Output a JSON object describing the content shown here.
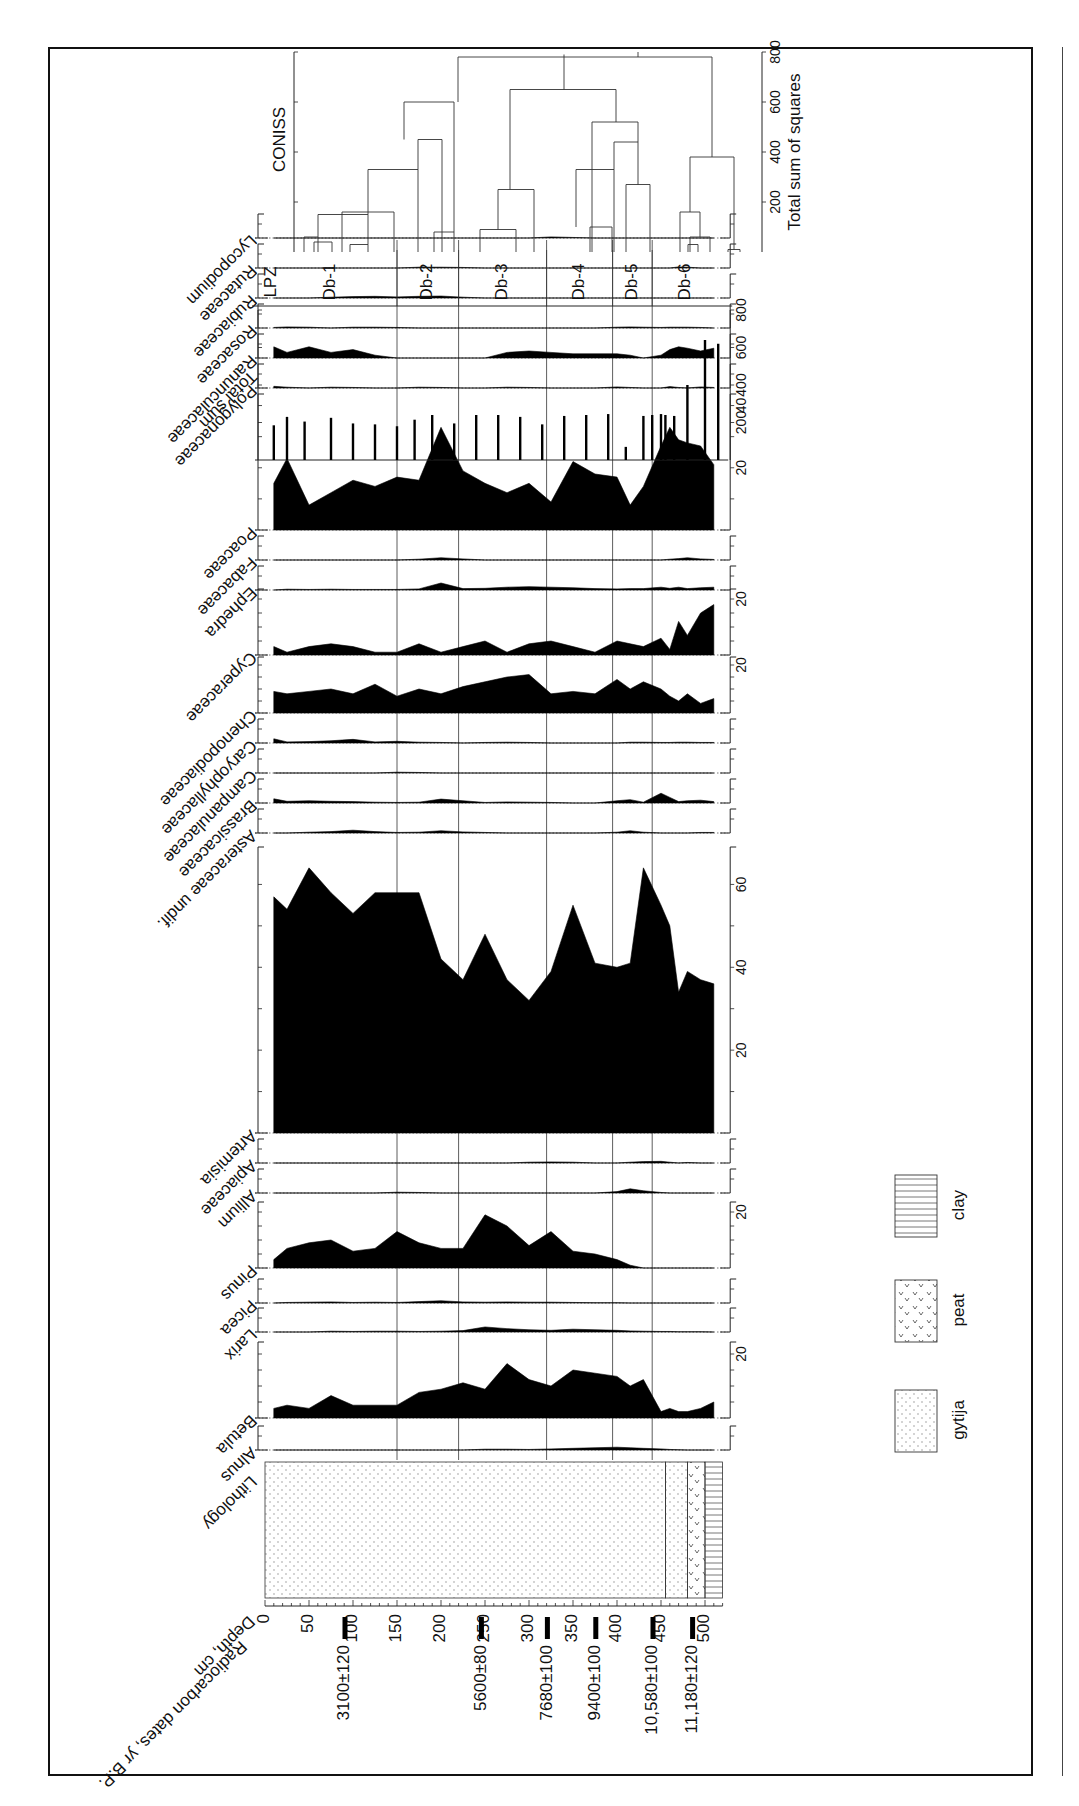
{
  "chart_data": {
    "type": "area",
    "orientation": "rotated 90 degrees (depth runs left-to-right across the page)",
    "depth_axis": {
      "label": "Depth, cm",
      "ticks": [
        0,
        50,
        100,
        150,
        200,
        250,
        300,
        350,
        400,
        450,
        500
      ],
      "range": [
        0,
        520
      ]
    },
    "radiocarbon_label": "Radiocarbon dates, yr B.P.",
    "radiocarbon_dates": [
      {
        "label": "3100±120",
        "depth": 100
      },
      {
        "label": "5600±80",
        "depth": 255
      },
      {
        "label": "7680±100",
        "depth": 330
      },
      {
        "label": "9400±100",
        "depth": 385
      },
      {
        "label": "10,580±100",
        "depth": 450
      },
      {
        "label": "11,180±120",
        "depth": 495
      }
    ],
    "lithology": {
      "label": "Lithology",
      "units": [
        {
          "type": "gytija",
          "from": 0,
          "to": 455
        },
        {
          "type": "gytija",
          "from": 455,
          "to": 480
        },
        {
          "type": "peat",
          "from": 480,
          "to": 500
        },
        {
          "type": "clay",
          "from": 500,
          "to": 520
        }
      ]
    },
    "legend": [
      {
        "name": "gytija",
        "pattern": "dots"
      },
      {
        "name": "peat",
        "pattern": "v-marks"
      },
      {
        "name": "clay",
        "pattern": "horizontal-lines"
      }
    ],
    "zones": {
      "label": "LPZ",
      "items": [
        {
          "name": "Db-1",
          "from": 0,
          "to": 150
        },
        {
          "name": "Db-2",
          "from": 150,
          "to": 220
        },
        {
          "name": "Db-3",
          "from": 220,
          "to": 320
        },
        {
          "name": "Db-4",
          "from": 320,
          "to": 395
        },
        {
          "name": "Db-5",
          "from": 395,
          "to": 440
        },
        {
          "name": "Db-6",
          "from": 440,
          "to": 520
        }
      ]
    },
    "sample_depths": [
      10,
      25,
      50,
      75,
      100,
      125,
      150,
      175,
      200,
      225,
      250,
      275,
      300,
      325,
      350,
      375,
      400,
      415,
      430,
      450,
      460,
      470,
      480,
      495,
      510
    ],
    "series": [
      {
        "name": "Alnus",
        "scale_max": 10,
        "ticks": [],
        "values": [
          0,
          0,
          0,
          0,
          0,
          0,
          0,
          0,
          0,
          0,
          0.3,
          0.3,
          0.2,
          0.4,
          0.6,
          0.8,
          1.0,
          0.8,
          0.6,
          0.4,
          0.2,
          0.1,
          0,
          0,
          0
        ]
      },
      {
        "name": "Betula",
        "scale_max": 25,
        "ticks": [
          20
        ],
        "values": [
          3,
          4,
          3,
          7,
          4,
          4,
          4,
          8,
          9,
          11,
          9,
          17,
          12,
          10,
          15,
          14,
          13,
          10,
          12,
          2,
          3,
          2,
          2,
          3,
          5
        ]
      },
      {
        "name": "Larix",
        "scale_max": 10,
        "ticks": [],
        "values": [
          0,
          0,
          0,
          0.3,
          0.2,
          0.3,
          0.3,
          0.2,
          0.3,
          0.5,
          1.8,
          1.2,
          0.8,
          0.6,
          1.0,
          0.8,
          0.6,
          0.4,
          0.3,
          0.2,
          0.2,
          0.1,
          0.1,
          0.1,
          0
        ]
      },
      {
        "name": "Picea",
        "scale_max": 10,
        "ticks": [],
        "values": [
          0,
          0.2,
          0.3,
          0.4,
          0.2,
          0.3,
          0.2,
          0.5,
          0.8,
          0.4,
          0.3,
          0.4,
          0.3,
          0.3,
          0.2,
          0.1,
          0.1,
          0,
          0,
          0,
          0,
          0,
          0,
          0,
          0
        ]
      },
      {
        "name": "Pinus",
        "scale_max": 25,
        "ticks": [
          20
        ],
        "values": [
          3,
          7,
          9,
          10,
          6,
          7,
          13,
          9,
          7,
          7,
          19,
          15,
          8,
          13,
          6,
          5,
          3,
          1,
          0,
          0,
          0,
          0,
          0,
          0,
          0
        ]
      },
      {
        "name": "Allium",
        "scale_max": 10,
        "ticks": [],
        "values": [
          0,
          0,
          0,
          0,
          0,
          0,
          0.3,
          0.2,
          0,
          0,
          0,
          0,
          0,
          0,
          0,
          0,
          0.5,
          1.5,
          0.8,
          0.2,
          0,
          0,
          0,
          0,
          0
        ]
      },
      {
        "name": "Apiaceae",
        "scale_max": 10,
        "ticks": [],
        "values": [
          0,
          0,
          0,
          0,
          0,
          0,
          0,
          0,
          0,
          0,
          0,
          0,
          0.3,
          0.4,
          0.3,
          0,
          0,
          0.3,
          0.5,
          0.6,
          0.3,
          0,
          0.2,
          0,
          0
        ]
      },
      {
        "name": "Artemisia",
        "scale_max": 70,
        "ticks": [
          20,
          40,
          60
        ],
        "values": [
          57,
          54,
          64,
          58,
          53,
          58,
          58,
          58,
          42,
          37,
          48,
          37,
          32,
          39,
          55,
          41,
          40,
          41,
          64,
          55,
          50,
          34,
          39,
          37,
          36
        ]
      },
      {
        "name": "Asteraceae undif.",
        "scale_max": 10,
        "ticks": [],
        "values": [
          0,
          0,
          0.3,
          0.5,
          1.0,
          0.5,
          0.2,
          0.3,
          0.8,
          0.4,
          0.2,
          0,
          0,
          0,
          0,
          0,
          0.3,
          0.8,
          0.3,
          0,
          0,
          0,
          0,
          0.2,
          0.2
        ]
      },
      {
        "name": "Brassicaceae",
        "scale_max": 10,
        "ticks": [],
        "values": [
          1.5,
          0.6,
          0.8,
          0.6,
          0.5,
          0.3,
          0.2,
          0.3,
          1.4,
          0.8,
          0.2,
          0.4,
          0.3,
          0.2,
          0,
          0,
          0.8,
          1.2,
          0.3,
          3.5,
          2.0,
          0.5,
          0.8,
          1.0,
          0.5
        ]
      },
      {
        "name": "Campanulaceae",
        "scale_max": 10,
        "ticks": [],
        "values": [
          0,
          0,
          0,
          0,
          0,
          0,
          0.3,
          0.2,
          0,
          0,
          0,
          0,
          0,
          0,
          0,
          0,
          0,
          0,
          0,
          0,
          0,
          0,
          0,
          0,
          0
        ]
      },
      {
        "name": "Caryophyllaceae",
        "scale_max": 10,
        "ticks": [],
        "values": [
          1.5,
          0.4,
          0.5,
          0.8,
          1.3,
          0.4,
          0.6,
          0.3,
          0.2,
          0,
          0.2,
          0.3,
          0.2,
          0,
          0,
          0,
          0,
          0.3,
          0.3,
          0.2,
          0.2,
          0.3,
          0.3,
          0.2,
          0.2
        ]
      },
      {
        "name": "Chenopodiaceae",
        "scale_max": 25,
        "ticks": [
          20
        ],
        "values": [
          9,
          8,
          9,
          10,
          8,
          12,
          7,
          10,
          8,
          11,
          13,
          15,
          16,
          8,
          9,
          8,
          14,
          10,
          13,
          10,
          7,
          5,
          8,
          4,
          6
        ]
      },
      {
        "name": "Cyperaceae",
        "scale_max": 25,
        "ticks": [
          20
        ],
        "values": [
          3,
          1,
          3,
          4,
          3,
          1,
          1,
          4,
          1,
          3,
          5,
          1,
          4,
          5,
          3,
          1,
          5,
          4,
          3,
          6,
          2,
          12,
          7,
          15,
          18
        ]
      },
      {
        "name": "Ephedra",
        "scale_max": 10,
        "ticks": [],
        "values": [
          0,
          0.3,
          0.2,
          0.3,
          0.2,
          0.2,
          0.2,
          0.4,
          2.5,
          0.5,
          0.6,
          1.0,
          1.2,
          1.0,
          0.8,
          0.5,
          0.4,
          0.5,
          0.5,
          1.0,
          0.6,
          1.0,
          0.5,
          0.8,
          1.0
        ]
      },
      {
        "name": "Fabaceae",
        "scale_max": 10,
        "ticks": [],
        "values": [
          0,
          0,
          0,
          0,
          0,
          0,
          0,
          0.3,
          0.8,
          0.4,
          0,
          0,
          0,
          0,
          0,
          0,
          0,
          0,
          0,
          0,
          0.3,
          0.5,
          0.8,
          0.4,
          0.2
        ]
      },
      {
        "name": "Poaceae",
        "scale_max": 45,
        "ticks": [
          20,
          40
        ],
        "values": [
          15,
          23,
          8,
          12,
          16,
          14,
          17,
          16,
          33,
          19,
          15,
          12,
          15,
          9,
          22,
          18,
          17,
          8,
          14,
          27,
          33,
          29,
          28,
          27,
          21
        ]
      },
      {
        "name": "Polygonaceae",
        "scale_max": 10,
        "ticks": [],
        "values": [
          0.6,
          0.3,
          0,
          0.3,
          0.2,
          0,
          0,
          0.3,
          0.2,
          0,
          0,
          0.3,
          0.2,
          0,
          0,
          0,
          0.4,
          0.2,
          0,
          0,
          0.5,
          0.2,
          0,
          0.4,
          0.2
        ]
      },
      {
        "name": "Ranunculaceae",
        "scale_max": 10,
        "ticks": [],
        "values": [
          4,
          2,
          4,
          2,
          3,
          1,
          0,
          0,
          0,
          0,
          0,
          2,
          2.5,
          2,
          1.5,
          1.5,
          1.5,
          1,
          0,
          1,
          3,
          4,
          3.5,
          2.5,
          3.5
        ]
      },
      {
        "name": "Rosaceae",
        "scale_max": 10,
        "ticks": [],
        "values": [
          0.2,
          0.4,
          0.3,
          0,
          0.3,
          0.3,
          0.2,
          0,
          0,
          0,
          0,
          0,
          0,
          0,
          0,
          0,
          0.3,
          0.4,
          0.3,
          0.2,
          0.3,
          0.3,
          0.3,
          0.2,
          0
        ]
      },
      {
        "name": "Rubiaceae",
        "scale_max": 10,
        "ticks": [],
        "values": [
          0,
          0,
          0,
          0.3,
          0.5,
          0.6,
          0.4,
          0.6,
          0.7,
          0.3,
          0,
          0,
          0,
          0,
          0,
          0,
          0,
          0,
          0,
          0,
          0,
          0,
          0,
          0,
          0
        ]
      },
      {
        "name": "Rutaceae",
        "scale_max": 10,
        "ticks": [],
        "values": [
          0,
          0,
          0,
          0,
          0,
          0,
          0,
          0.3,
          0.3,
          0.2,
          0,
          0,
          0,
          0,
          0,
          0,
          0,
          0,
          0,
          0,
          0,
          0.4,
          0.3,
          0,
          0
        ]
      },
      {
        "name": "Lycopodium",
        "scale_max": 10,
        "ticks": [],
        "values": [
          0,
          0,
          0,
          0,
          0,
          0,
          0,
          0,
          0,
          0,
          0,
          0,
          0,
          0.4,
          0.2,
          0,
          0,
          0,
          0,
          0,
          0,
          0,
          0,
          0,
          0
        ]
      }
    ],
    "total_sum": {
      "name": "Total sum",
      "ticks": [
        200,
        400,
        600,
        800
      ],
      "range": [
        0,
        800
      ],
      "depths": [
        10,
        25,
        45,
        75,
        100,
        125,
        150,
        170,
        190,
        215,
        240,
        265,
        290,
        315,
        340,
        365,
        390,
        410,
        430,
        440,
        450,
        455,
        465,
        480,
        500,
        515
      ],
      "values": [
        185,
        230,
        205,
        225,
        195,
        190,
        180,
        215,
        240,
        195,
        240,
        240,
        230,
        190,
        235,
        240,
        245,
        70,
        235,
        240,
        245,
        240,
        235,
        400,
        640,
        620
      ]
    },
    "coniss": {
      "name": "CONISS",
      "xlabel": "Total sum of squares",
      "ticks": [
        200,
        400,
        600,
        800
      ],
      "range": [
        0,
        800
      ]
    },
    "xlabel": "Depth, cm",
    "ylabel": "Percent"
  },
  "labels": {
    "radiocarbon": "Radiocarbon dates, yr B.P.",
    "depth": "Depth, cm",
    "lithology": "Lithology",
    "total_sum": "Total sum",
    "lpz": "LPZ",
    "coniss": "CONISS",
    "coniss_axis": "Total sum of squares"
  }
}
